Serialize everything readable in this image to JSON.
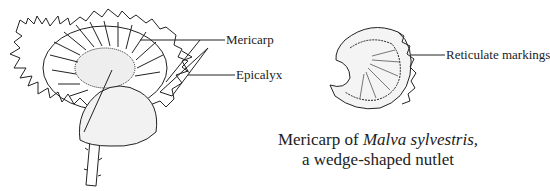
{
  "diagram": {
    "labels": {
      "mericarp": "Mericarp",
      "epicalyx": "Epicalyx",
      "reticulate": "Reticulate markings"
    },
    "caption": {
      "line1_prefix": "Mericarp of ",
      "line1_species": "Malva sylvestris,",
      "line2": "a wedge-shaped nutlet"
    },
    "figures": [
      {
        "name": "mallow-fruit-with-epicalyx",
        "description": "Malva fruit (schizocarp) surrounded by epicalyx and calyx lobes on stalk"
      },
      {
        "name": "mericarp-closeup",
        "description": "Single mericarp with reticulate markings"
      }
    ]
  }
}
